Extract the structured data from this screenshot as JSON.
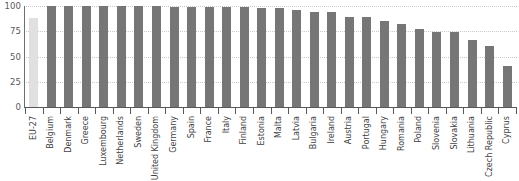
{
  "chart_data": {
    "type": "bar",
    "title": "",
    "subtitle": "",
    "xlabel": "",
    "ylabel": "",
    "ylim": [
      0,
      100
    ],
    "yticks": [
      0,
      25,
      50,
      75,
      100
    ],
    "ytick_labels": [
      "0",
      "25",
      "50",
      "75",
      "100"
    ],
    "grid": true,
    "legend": "none",
    "orientation": "vertical",
    "xtick_label_rotation": 90,
    "colors": {
      "bar": "#767676",
      "highlight_bar": "#e0e0e0",
      "gridline": "#c8c8cc",
      "axis": "#58585a",
      "tick_text": "#58585a",
      "category_text": "#414142",
      "background": "#ffffff"
    },
    "highlight_category": "EU-27",
    "categories": [
      "EU-27",
      "Belgium",
      "Denmark",
      "Greece",
      "Luxembourg",
      "Netherlands",
      "Sweden",
      "United Kingdom",
      "Germany",
      "Spain",
      "France",
      "Italy",
      "Finland",
      "Estonia",
      "Malta",
      "Latvia",
      "Bulgaria",
      "Ireland",
      "Austria",
      "Portugal",
      "Hungary",
      "Romania",
      "Poland",
      "Slovenia",
      "Slovakia",
      "Lithuania",
      "Czech Republic",
      "Cyprus"
    ],
    "values": [
      88,
      100,
      100,
      100,
      100,
      100,
      100,
      100,
      99,
      99,
      99,
      99,
      99,
      98,
      98,
      96,
      94,
      94,
      89,
      89,
      85,
      82,
      77,
      74,
      74,
      66,
      60,
      41
    ]
  }
}
